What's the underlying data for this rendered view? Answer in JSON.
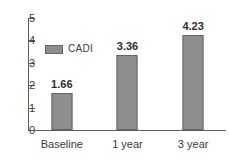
{
  "chart_data": {
    "type": "bar",
    "title": "",
    "xlabel": "",
    "ylabel": "",
    "categories": [
      "Baseline",
      "1 year",
      "3 year"
    ],
    "values": [
      1.66,
      3.36,
      4.23
    ],
    "data_labels": [
      "1.66",
      "3.36",
      "4.23"
    ],
    "series": [
      {
        "name": "CADI",
        "values": [
          1.66,
          3.36,
          4.23
        ],
        "color": "#8e8e8e"
      }
    ],
    "ylim": [
      0,
      5
    ],
    "ytick_labels": [
      "5",
      "4",
      "3",
      "2",
      "1",
      "0"
    ],
    "ytick_values": [
      5,
      4,
      3,
      2,
      1,
      0
    ],
    "grid": false,
    "legend": {
      "position": "inside-upper-left",
      "entries": [
        {
          "label": "CADI",
          "color": "#8e8e8e"
        }
      ]
    },
    "colors": {
      "bar_fill": "#8e8e8e",
      "bar_border": "#666666",
      "axis": "#5d5d5d",
      "text": "#3a3a3a",
      "background": "#ffffff"
    }
  }
}
